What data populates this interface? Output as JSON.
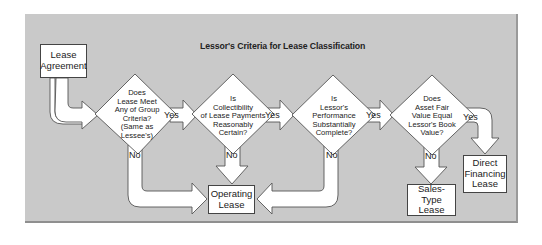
{
  "diagram": {
    "title": "Lessor's Criteria for Lease Classification",
    "colors": {
      "panel_background": "#c9c9c9",
      "shape_fill": "#ffffff",
      "shape_stroke": "#555555",
      "text": "#222222"
    },
    "start": {
      "line1": "Lease",
      "line2": "Agreement"
    },
    "decisions": [
      {
        "id": "group-criteria",
        "lines": [
          "Does",
          "Lease Meet",
          "Any of Group",
          "Criteria?",
          "(Same as",
          "Lessee's)"
        ],
        "yes_label": "Yes",
        "no_label": "No"
      },
      {
        "id": "collectibility",
        "lines": [
          "Is",
          "Collectibility",
          "of Lease Payments",
          "Reasonably",
          "Certain?"
        ],
        "yes_label": "Yes",
        "no_label": "No"
      },
      {
        "id": "performance",
        "lines": [
          "Is",
          "Lessor's",
          "Performance",
          "Substantially",
          "Complete?"
        ],
        "yes_label": "Yes",
        "no_label": "No"
      },
      {
        "id": "fair-value",
        "lines": [
          "Does",
          "Asset Fair",
          "Value Equal",
          "Lessor's Book",
          "Value?"
        ],
        "yes_label": "Yes",
        "no_label": "No"
      }
    ],
    "outcomes": {
      "operating": {
        "line1": "Operating",
        "line2": "Lease"
      },
      "sales_type": {
        "line1": "Sales-Type",
        "line2": "Lease"
      },
      "direct_financing": {
        "line1": "Direct",
        "line2": "Financing",
        "line3": "Lease"
      }
    },
    "edges": [
      {
        "from": "Lease Agreement",
        "to": "group-criteria",
        "label": ""
      },
      {
        "from": "group-criteria",
        "to": "collectibility",
        "label": "Yes"
      },
      {
        "from": "group-criteria",
        "to": "Operating Lease",
        "label": "No"
      },
      {
        "from": "collectibility",
        "to": "performance",
        "label": "Yes"
      },
      {
        "from": "collectibility",
        "to": "Operating Lease",
        "label": "No"
      },
      {
        "from": "performance",
        "to": "fair-value",
        "label": "Yes"
      },
      {
        "from": "performance",
        "to": "Operating Lease",
        "label": "No"
      },
      {
        "from": "fair-value",
        "to": "Direct Financing Lease",
        "label": "Yes"
      },
      {
        "from": "fair-value",
        "to": "Sales-Type Lease",
        "label": "No"
      }
    ]
  }
}
